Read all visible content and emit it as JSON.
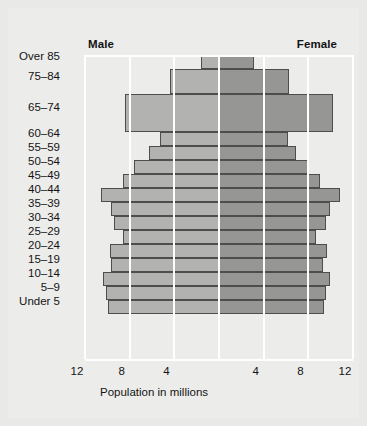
{
  "chart": {
    "male_label": "Male",
    "female_label": "Female",
    "xaxis_title": "Population in millions",
    "tick_labels": [
      "12",
      "8",
      "4",
      "4",
      "8",
      "12"
    ],
    "colors": {
      "male_bar": "#b2b2b0",
      "female_bar": "#969694",
      "bar_outline": "#4d4d4d",
      "gridline": "#ffffff",
      "background": "#e9e9e7",
      "plot_background": "#ececeb",
      "text": "#141414"
    }
  },
  "chart_data": {
    "type": "bar",
    "subtype": "population-pyramid",
    "title": "",
    "xlabel": "Population in millions",
    "ylabel": "",
    "xlim": [
      -12,
      12
    ],
    "xticks": [
      -12,
      -8,
      -4,
      0,
      4,
      8,
      12
    ],
    "xtick_labels": [
      "12",
      "8",
      "4",
      "",
      "4",
      "8",
      "12"
    ],
    "grid": true,
    "legend_position": "top",
    "categories": [
      "Over 85",
      "75–84",
      "65–74",
      "60–64",
      "55–59",
      "50–54",
      "45–49",
      "40–44",
      "35–39",
      "30–34",
      "25–29",
      "20–24",
      "15–19",
      "10–14",
      "5–9",
      "Under 5"
    ],
    "category_band_heights": [
      14,
      25,
      38,
      14,
      14,
      14,
      14,
      14,
      14,
      14,
      14,
      14,
      14,
      14,
      14,
      14
    ],
    "series": [
      {
        "name": "Male",
        "side": "left",
        "values": [
          1.6,
          4.4,
          8.4,
          5.3,
          6.3,
          7.6,
          8.6,
          10.6,
          9.7,
          9.4,
          8.6,
          9.8,
          9.7,
          10.4,
          10.1,
          9.9
        ]
      },
      {
        "name": "Female",
        "side": "right",
        "values": [
          3.1,
          6.3,
          10.2,
          6.2,
          6.9,
          8.1,
          9.0,
          10.8,
          9.9,
          9.6,
          8.7,
          9.7,
          9.3,
          9.9,
          9.6,
          9.4
        ]
      }
    ],
    "units": "millions"
  }
}
